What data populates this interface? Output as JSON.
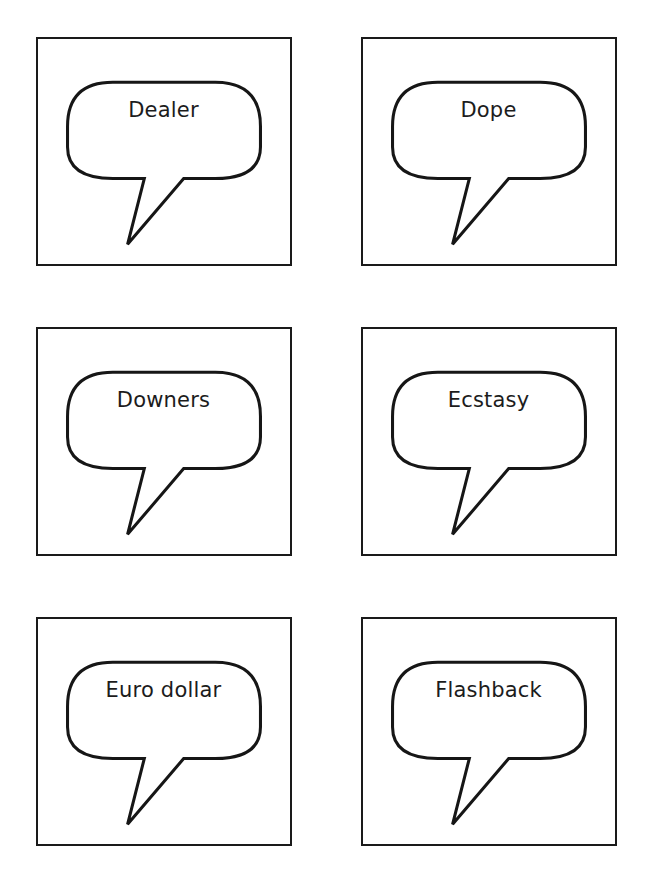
{
  "page": {
    "background_color": "#ffffff",
    "layout": "3x2-grid-of-speech-bubble-cards",
    "card_border_color": "#1a1a1a",
    "bubble_stroke_color": "#161616",
    "text_color": "#1c1c1c"
  },
  "cards": [
    {
      "label": "Dealer",
      "icon": "speech-bubble-icon"
    },
    {
      "label": "Dope",
      "icon": "speech-bubble-icon"
    },
    {
      "label": "Downers",
      "icon": "speech-bubble-icon"
    },
    {
      "label": "Ecstasy",
      "icon": "speech-bubble-icon"
    },
    {
      "label": "Euro dollar",
      "icon": "speech-bubble-icon"
    },
    {
      "label": "Flashback",
      "icon": "speech-bubble-icon"
    }
  ]
}
